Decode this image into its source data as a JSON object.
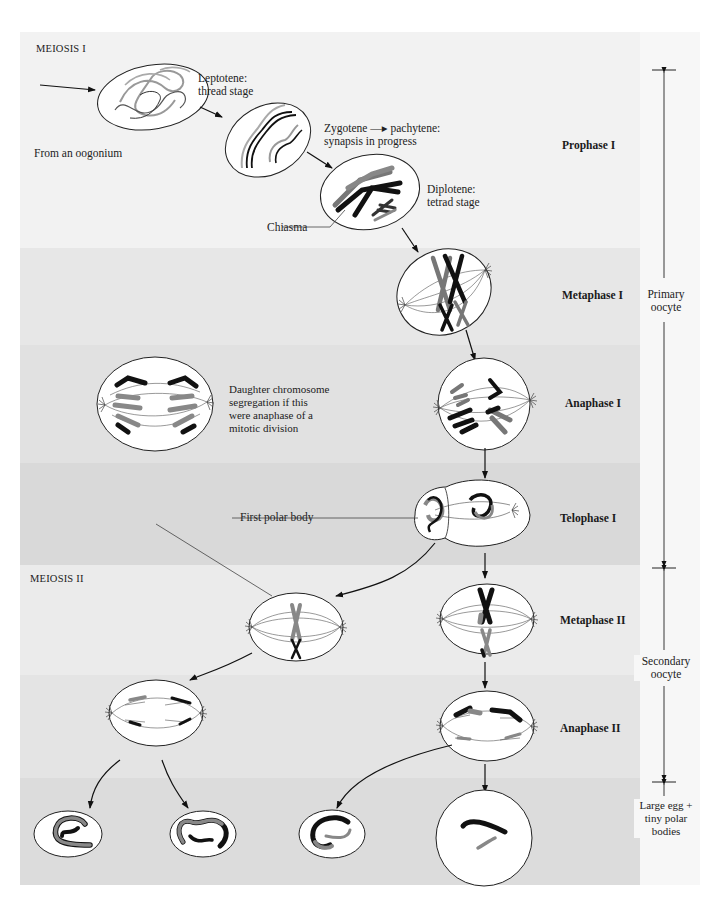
{
  "sections": {
    "meiosis_1": "MEIOSIS I",
    "meiosis_2": "MEIOSIS II"
  },
  "annotations": {
    "from_oogonium": "From an oogonium",
    "leptotene": [
      "Leptotene:",
      "thread stage"
    ],
    "zygotene": [
      "Zygotene —▸ pachytene:",
      "synapsis in progress"
    ],
    "diplotene": [
      "Diplotene:",
      "tetrad stage"
    ],
    "chiasma": "Chiasma",
    "mitotic_comparison": [
      "Daughter chromosome",
      "segregation if this",
      "were anaphase of a",
      "mitotic division"
    ],
    "first_polar_body": "First polar body"
  },
  "stages": [
    {
      "id": "prophase-1",
      "label": "Prophase I",
      "band_top": 0,
      "band_height": 216,
      "color": "#f2f2f2"
    },
    {
      "id": "metaphase-1",
      "label": "Metaphase I",
      "band_top": 216,
      "band_height": 97,
      "color": "#e7e7e7"
    },
    {
      "id": "anaphase-1",
      "label": "Anaphase I",
      "band_top": 313,
      "band_height": 118,
      "color": "#e1e1e1"
    },
    {
      "id": "telophase-1",
      "label": "Telophase I",
      "band_top": 431,
      "band_height": 102,
      "color": "#d9d9d9"
    },
    {
      "id": "metaphase-2",
      "label": "Metaphase II",
      "band_top": 533,
      "band_height": 110,
      "color": "#ebebeb"
    },
    {
      "id": "anaphase-2",
      "label": "Anaphase II",
      "band_top": 643,
      "band_height": 103,
      "color": "#e4e4e4"
    },
    {
      "id": "products",
      "label": "",
      "band_top": 746,
      "band_height": 107,
      "color": "#dcdcdc"
    }
  ],
  "cell_stages": {
    "primary_oocyte": [
      "Primary",
      "oocyte"
    ],
    "secondary_oocyte": [
      "Secondary",
      "oocyte"
    ],
    "final": [
      "Large egg +",
      "tiny polar",
      "bodies"
    ]
  }
}
